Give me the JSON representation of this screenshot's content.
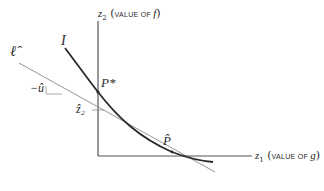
{
  "diagram": {
    "y_axis": {
      "var": "z",
      "sub": "2",
      "paren_open": "(",
      "desc": "VALUE OF ",
      "fn": "f",
      "paren_close": ")"
    },
    "x_axis": {
      "var": "z",
      "sub": "1",
      "paren_open": "(",
      "desc": "VALUE OF ",
      "fn": "g",
      "paren_close": ")"
    },
    "curve_label": "I",
    "line_label": "ℓ̂",
    "point_star": "P*",
    "point_hat": "P̂",
    "intercept_label": "ẑ₂",
    "slope_label": "−û",
    "colors": {
      "curve": "#2a2a2a",
      "line": "#8a8a8a",
      "axis": "#555555"
    }
  }
}
